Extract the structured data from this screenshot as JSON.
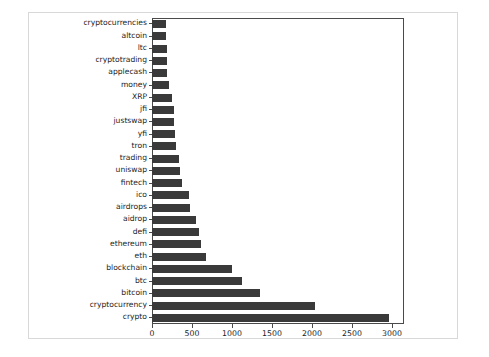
{
  "chart_data": {
    "type": "bar",
    "orientation": "horizontal",
    "title": "",
    "xlabel": "",
    "ylabel": "",
    "xlim": [
      0,
      3150
    ],
    "ylim_categories": 23,
    "grid": false,
    "legend": null,
    "bar_color": "#3a3a3a",
    "axis_color": "#4a4a4a",
    "xticks": [
      0,
      500,
      1000,
      1500,
      2000,
      2500,
      3000
    ],
    "xticklabels": [
      "0",
      "500",
      "1000",
      "1500",
      "2000",
      "2500",
      "3000"
    ],
    "categories": [
      "cryptocurrencies",
      "altcoin",
      "ltc",
      "cryptotrading",
      "applecash",
      "money",
      "XRP",
      "jfi",
      "justswap",
      "yfi",
      "tron",
      "trading",
      "uniswap",
      "fintech",
      "ico",
      "airdrops",
      "aidrop",
      "defi",
      "ethereum",
      "eth",
      "blockchain",
      "btc",
      "bitcoin",
      "cryptocurrency",
      "crypto"
    ],
    "values": [
      180,
      180,
      185,
      190,
      190,
      215,
      250,
      270,
      275,
      290,
      295,
      340,
      355,
      375,
      460,
      475,
      555,
      590,
      615,
      675,
      1005,
      1130,
      1350,
      2040,
      2965
    ]
  }
}
